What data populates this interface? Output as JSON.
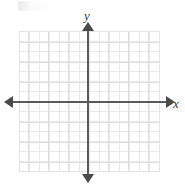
{
  "figure": {
    "kind": "cartesian-coordinate-plane",
    "width": 185,
    "height": 187,
    "background_color": "#ffffff"
  },
  "axes": {
    "x_label": "x",
    "y_label": "y",
    "axis_color": "#5a5a5a",
    "arrowhead_color": "#4a4a4a",
    "x_axis_has_left_arrow": true,
    "x_axis_has_right_arrow": true,
    "y_axis_has_top_arrow": true,
    "y_axis_has_bottom_arrow": true,
    "tick_labels_x": [],
    "tick_labels_y": [],
    "origin_x_px": 88,
    "origin_y_px": 102
  },
  "grid": {
    "color": "#e9e9e9",
    "major_color": "#dedede",
    "cell_size_px": 10,
    "columns": 14,
    "rows": 14,
    "left_px": 19,
    "top_px": 31,
    "width_px": 140,
    "height_px": 140,
    "visible": true
  },
  "artifact": {
    "label": "",
    "description": "faint cropped mark at top-left"
  },
  "chart_data": {
    "type": "scatter",
    "title": "",
    "subtitle": "",
    "xlabel": "x",
    "ylabel": "y",
    "xlim": [
      -7,
      7
    ],
    "ylim": [
      -7,
      7
    ],
    "xticks": [
      -7,
      -6,
      -5,
      -4,
      -3,
      -2,
      -1,
      0,
      1,
      2,
      3,
      4,
      5,
      6,
      7
    ],
    "yticks": [
      -7,
      -6,
      -5,
      -4,
      -3,
      -2,
      -1,
      0,
      1,
      2,
      3,
      4,
      5,
      6,
      7
    ],
    "tick_labels_shown": false,
    "grid": true,
    "legend": null,
    "series": [],
    "annotations": [],
    "note": "Empty blank coordinate grid with labeled x and y axes; no plotted data points or curves."
  }
}
